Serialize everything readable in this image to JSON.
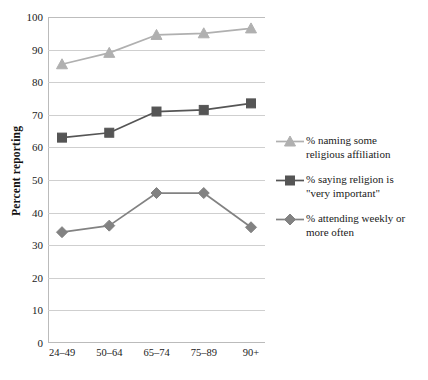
{
  "chart_data": {
    "type": "line",
    "title": "",
    "xlabel": "",
    "ylabel": "Percent reporting",
    "categories": [
      "24–49",
      "50–64",
      "65–74",
      "75–89",
      "90+"
    ],
    "ylim": [
      0,
      100
    ],
    "ytick_step": 10,
    "yticks": [
      "0",
      "10",
      "20",
      "30",
      "40",
      "50",
      "60",
      "70",
      "80",
      "90",
      "100"
    ],
    "grid": "horizontal",
    "legend_position": "right",
    "series": [
      {
        "name": "% naming some religious affiliation",
        "legend_label_line1": "% naming some",
        "legend_label_line2": "religious affiliation",
        "marker": "triangle",
        "color": "#b0b0b0",
        "values": [
          85.5,
          89,
          94.5,
          95,
          96.5
        ]
      },
      {
        "name": "% saying religion is \"very important\"",
        "legend_label_line1": "% saying religion is",
        "legend_label_line2": "\"very important\"",
        "marker": "square",
        "color": "#555555",
        "values": [
          63,
          64.5,
          71,
          71.5,
          73.5
        ]
      },
      {
        "name": "% attending weekly or more often",
        "legend_label_line1": "% attending weekly or",
        "legend_label_line2": "more often",
        "marker": "diamond",
        "color": "#828282",
        "values": [
          34,
          36,
          46,
          46,
          35.5
        ]
      }
    ]
  },
  "colors": {
    "background": "#ffffff",
    "gridline": "#cfcfcf",
    "axis": "#bbbbbb",
    "text": "#1a1a1a",
    "series_affiliation": "#b0b0b0",
    "series_important": "#555555",
    "series_attending": "#828282"
  }
}
